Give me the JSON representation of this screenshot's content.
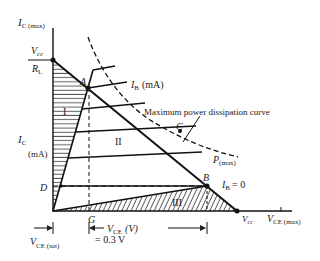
{
  "diagram": {
    "axes": {
      "y_max_label": "I",
      "y_max_sub": "C (max)",
      "y_label": "I",
      "y_label_sub": "C",
      "y_unit": "(mA)",
      "x_label": "V",
      "x_label_sub": "CE",
      "x_unit": "(V)",
      "x_max_label": "V",
      "x_max_sub": "CE (max)"
    },
    "intercepts": {
      "y_num": "V",
      "y_num_sub": "cc",
      "y_den": "R",
      "y_den_sub": "L",
      "x_label": "V",
      "x_label_sub": "cc"
    },
    "points": {
      "A": "A",
      "B": "B",
      "C": "C",
      "D": "D",
      "G": "G"
    },
    "regions": {
      "r1": "I",
      "r2": "II",
      "r3": "III"
    },
    "curves": {
      "ib_label": "I",
      "ib_sub": "B",
      "ib_unit": "(mA)",
      "ib_zero": "= 0",
      "pmax_label": "P",
      "pmax_sub": "(max)",
      "pmax_annotation": "Maximum power dissipation curve"
    },
    "vce_sat": {
      "label": "V",
      "sub": "CE (sat)",
      "value": "= 0.3 V"
    }
  }
}
